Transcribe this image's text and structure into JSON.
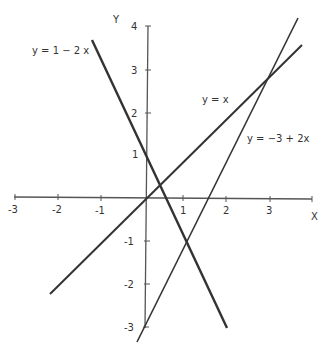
{
  "diagram": {
    "axes": {
      "x_label": "X",
      "y_label": "Y",
      "x_ticks": [
        "-3",
        "-2",
        "-1",
        "1",
        "2",
        "3"
      ],
      "y_ticks": [
        "4",
        "3",
        "2",
        "1",
        "-1",
        "-2",
        "-3"
      ]
    },
    "lines": [
      {
        "label": "y = 1 − 2 x",
        "equation": "y = 1 - 2x"
      },
      {
        "label": "y = x",
        "equation": "y = x"
      },
      {
        "label": "y = −3  +  2x",
        "equation": "y = -3 + 2x"
      }
    ],
    "colors": {
      "line": "#333333",
      "axis": "#555555"
    }
  }
}
